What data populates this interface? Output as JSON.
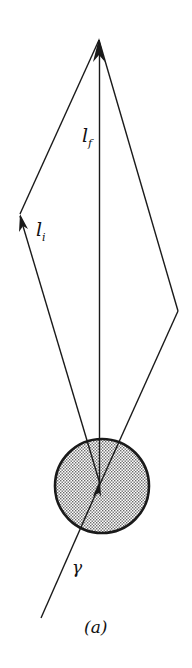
{
  "figure": {
    "caption": "(a)",
    "labels": {
      "l_f": {
        "main": "l",
        "sub": "f"
      },
      "l_i": {
        "main": "l",
        "sub": "i"
      },
      "gamma": "γ"
    },
    "colors": {
      "stroke": "#1a1a1a",
      "fill_dots": "#9a9a9a",
      "background": "#ffffff"
    }
  }
}
